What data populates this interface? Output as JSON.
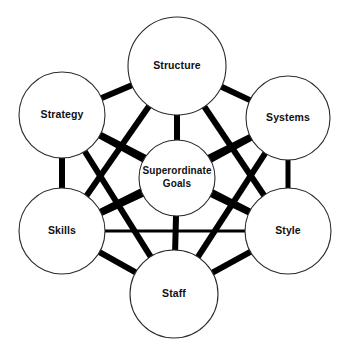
{
  "diagram": {
    "name": "McKinsey 7S Framework",
    "type": "network-diagram",
    "background_color": "#ffffff",
    "node_fill_color": "#ffffff",
    "node_stroke_color": "#2b2b2b",
    "link_color": "#000000",
    "label_color": "#111111",
    "nodes": [
      {
        "id": "structure",
        "label": "Structure",
        "lines": [
          "Structure"
        ],
        "cx": 177,
        "cy": 66,
        "r": 49
      },
      {
        "id": "strategy",
        "label": "Strategy",
        "lines": [
          "Strategy"
        ],
        "cx": 62,
        "cy": 115,
        "r": 43
      },
      {
        "id": "systems",
        "label": "Systems",
        "lines": [
          "Systems"
        ],
        "cx": 288,
        "cy": 118,
        "r": 42
      },
      {
        "id": "superordinate-goals",
        "label": "Superordinate Goals",
        "lines": [
          "Superordinate",
          "Goals"
        ],
        "cx": 177,
        "cy": 178,
        "r": 38
      },
      {
        "id": "skills",
        "label": "Skills",
        "lines": [
          "Skills"
        ],
        "cx": 62,
        "cy": 231,
        "r": 43
      },
      {
        "id": "style",
        "label": "Style",
        "lines": [
          "Style"
        ],
        "cx": 288,
        "cy": 231,
        "r": 43
      },
      {
        "id": "staff",
        "label": "Staff",
        "lines": [
          "Staff"
        ],
        "cx": 174,
        "cy": 294,
        "r": 44
      }
    ],
    "links": [
      {
        "from": "strategy",
        "to": "structure",
        "width": 6
      },
      {
        "from": "structure",
        "to": "systems",
        "width": 6
      },
      {
        "from": "strategy",
        "to": "skills",
        "width": 6
      },
      {
        "from": "systems",
        "to": "style",
        "width": 5
      },
      {
        "from": "skills",
        "to": "staff",
        "width": 6
      },
      {
        "from": "staff",
        "to": "style",
        "width": 6
      },
      {
        "from": "structure",
        "to": "superordinate-goals",
        "width": 6
      },
      {
        "from": "strategy",
        "to": "superordinate-goals",
        "width": 6
      },
      {
        "from": "systems",
        "to": "superordinate-goals",
        "width": 6
      },
      {
        "from": "skills",
        "to": "superordinate-goals",
        "width": 6
      },
      {
        "from": "style",
        "to": "superordinate-goals",
        "width": 6
      },
      {
        "from": "staff",
        "to": "superordinate-goals",
        "width": 6
      },
      {
        "from": "skills",
        "to": "style",
        "width": 3
      },
      {
        "from": "strategy",
        "to": "staff",
        "width": 6
      },
      {
        "from": "structure",
        "to": "skills",
        "width": 6
      },
      {
        "from": "structure",
        "to": "style",
        "width": 6
      },
      {
        "from": "systems",
        "to": "staff",
        "width": 6
      },
      {
        "from": "systems",
        "to": "skills",
        "width": 6
      },
      {
        "from": "strategy",
        "to": "style",
        "width": 6
      }
    ]
  }
}
